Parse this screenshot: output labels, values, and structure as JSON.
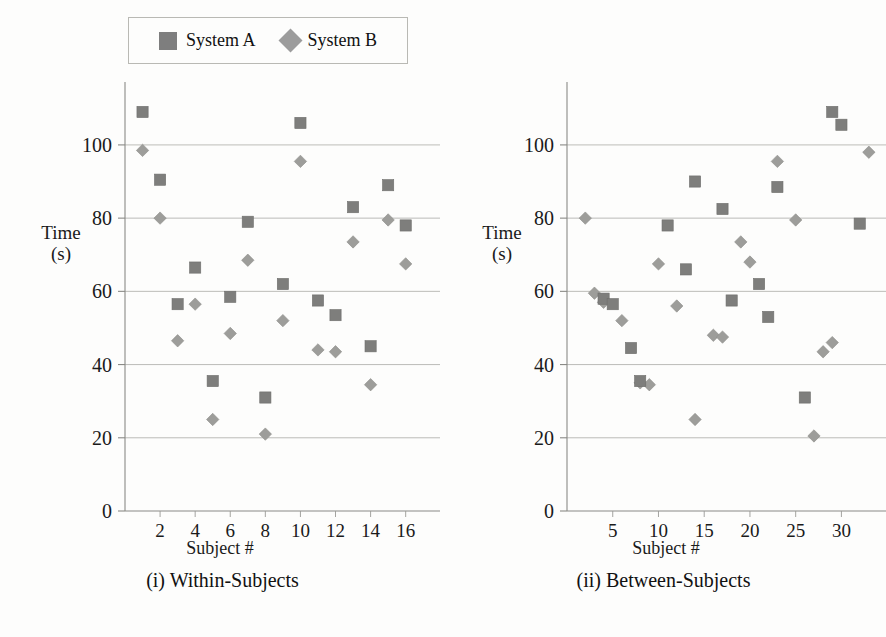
{
  "figure": {
    "background": "#fdfdfc",
    "legend": {
      "position": "top-left",
      "entries": [
        {
          "label": "System A",
          "marker": "square",
          "color": "#7e7e7e"
        },
        {
          "label": "System B",
          "marker": "diamond",
          "color": "#9c9c9c"
        }
      ]
    }
  },
  "panels": [
    {
      "caption": "(i) Within-Subjects",
      "xlabel": "Subject #",
      "ylabel_line1": "Time",
      "ylabel_line2": "(s)"
    },
    {
      "caption": "(ii) Between-Subjects",
      "xlabel": "Subject #",
      "ylabel_line1": "Time",
      "ylabel_line2": "(s)"
    }
  ],
  "chart_data": [
    {
      "type": "scatter",
      "title": "(i) Within-Subjects",
      "xlabel": "Subject #",
      "ylabel": "Time (s)",
      "xlim": [
        0,
        17.5
      ],
      "ylim": [
        0,
        115
      ],
      "xticks": [
        2,
        4,
        6,
        8,
        10,
        12,
        14,
        16
      ],
      "yticks": [
        0,
        20,
        40,
        60,
        80,
        100
      ],
      "grid": "horizontal",
      "legend_position": "top-left",
      "x": [
        1,
        2,
        3,
        4,
        5,
        6,
        7,
        8,
        9,
        10,
        11,
        12,
        13,
        14,
        15,
        16
      ],
      "series": [
        {
          "name": "System A",
          "marker": "square",
          "color": "#7e7e7e",
          "values": [
            109,
            90.5,
            null,
            66.5,
            35.5,
            58.5,
            79,
            31,
            62,
            106,
            57.5,
            53.5,
            83,
            45,
            89,
            78
          ]
        },
        {
          "name": "System B",
          "marker": "diamond",
          "color": "#9c9c9c",
          "values": [
            98.5,
            80,
            56.5,
            46.5,
            25,
            48.5,
            68.5,
            21,
            52,
            95.5,
            44,
            43.5,
            73.5,
            34.5,
            79.5,
            67.5
          ]
        }
      ],
      "points_system_a": [
        {
          "x": 1,
          "y": 109
        },
        {
          "x": 2,
          "y": 90.5
        },
        {
          "x": 3,
          "y": 56.5
        },
        {
          "x": 4,
          "y": 66.5
        },
        {
          "x": 5,
          "y": 35.5
        },
        {
          "x": 6,
          "y": 58.5
        },
        {
          "x": 7,
          "y": 79
        },
        {
          "x": 8,
          "y": 31
        },
        {
          "x": 9,
          "y": 62
        },
        {
          "x": 10,
          "y": 106
        },
        {
          "x": 11,
          "y": 57.5
        },
        {
          "x": 12,
          "y": 53.5
        },
        {
          "x": 13,
          "y": 83
        },
        {
          "x": 14,
          "y": 45
        },
        {
          "x": 15,
          "y": 89
        },
        {
          "x": 16,
          "y": 78
        }
      ],
      "points_system_b": [
        {
          "x": 1,
          "y": 98.5
        },
        {
          "x": 2,
          "y": 80
        },
        {
          "x": 3,
          "y": 46.5
        },
        {
          "x": 4,
          "y": 56.5
        },
        {
          "x": 5,
          "y": 25
        },
        {
          "x": 6,
          "y": 48.5
        },
        {
          "x": 7,
          "y": 68.5
        },
        {
          "x": 8,
          "y": 21
        },
        {
          "x": 9,
          "y": 52
        },
        {
          "x": 10,
          "y": 95.5
        },
        {
          "x": 11,
          "y": 44
        },
        {
          "x": 12,
          "y": 43.5
        },
        {
          "x": 13,
          "y": 73.5
        },
        {
          "x": 14,
          "y": 34.5
        },
        {
          "x": 15,
          "y": 79.5
        },
        {
          "x": 16,
          "y": 67.5
        }
      ]
    },
    {
      "type": "scatter",
      "title": "(ii) Between-Subjects",
      "xlabel": "Subject #",
      "ylabel": "Time (s)",
      "xlim": [
        0,
        34
      ],
      "ylim": [
        0,
        115
      ],
      "xticks": [
        5,
        10,
        15,
        20,
        25,
        30
      ],
      "yticks": [
        0,
        20,
        40,
        60,
        80,
        100
      ],
      "grid": "horizontal",
      "legend_position": "none",
      "points_system_a": [
        {
          "x": 4,
          "y": 58
        },
        {
          "x": 5,
          "y": 56.5
        },
        {
          "x": 7,
          "y": 44.5
        },
        {
          "x": 8,
          "y": 35.5
        },
        {
          "x": 11,
          "y": 78
        },
        {
          "x": 13,
          "y": 66
        },
        {
          "x": 14,
          "y": 90
        },
        {
          "x": 17,
          "y": 82.5
        },
        {
          "x": 18,
          "y": 57.5
        },
        {
          "x": 21,
          "y": 62
        },
        {
          "x": 22,
          "y": 53
        },
        {
          "x": 23,
          "y": 88.5
        },
        {
          "x": 26,
          "y": 31
        },
        {
          "x": 29,
          "y": 109
        },
        {
          "x": 30,
          "y": 105.5
        },
        {
          "x": 32,
          "y": 78.5
        }
      ],
      "points_system_b": [
        {
          "x": 2,
          "y": 80
        },
        {
          "x": 3,
          "y": 59.5
        },
        {
          "x": 4,
          "y": 57
        },
        {
          "x": 6,
          "y": 52
        },
        {
          "x": 8,
          "y": 35
        },
        {
          "x": 9,
          "y": 34.5
        },
        {
          "x": 10,
          "y": 67.5
        },
        {
          "x": 12,
          "y": 56
        },
        {
          "x": 14,
          "y": 25
        },
        {
          "x": 16,
          "y": 48
        },
        {
          "x": 17,
          "y": 47.5
        },
        {
          "x": 19,
          "y": 73.5
        },
        {
          "x": 20,
          "y": 68
        },
        {
          "x": 23,
          "y": 95.5
        },
        {
          "x": 25,
          "y": 79.5
        },
        {
          "x": 27,
          "y": 20.5
        },
        {
          "x": 28,
          "y": 43.5
        },
        {
          "x": 29,
          "y": 46
        },
        {
          "x": 33,
          "y": 98
        }
      ]
    }
  ]
}
